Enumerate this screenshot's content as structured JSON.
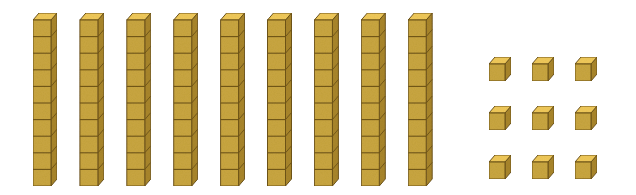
{
  "diagram": {
    "colors": {
      "front": "#c9a640",
      "top": "#f0c95a",
      "side": "#a9862c",
      "outline": "#6e5418",
      "background": "#ffffff"
    },
    "rods": {
      "count": 9,
      "cubes_per_rod": 10,
      "label": "tens rods"
    },
    "units": {
      "count": 9,
      "rows": 3,
      "cols": 3,
      "label": "unit cubes"
    },
    "represented_value": 99
  }
}
